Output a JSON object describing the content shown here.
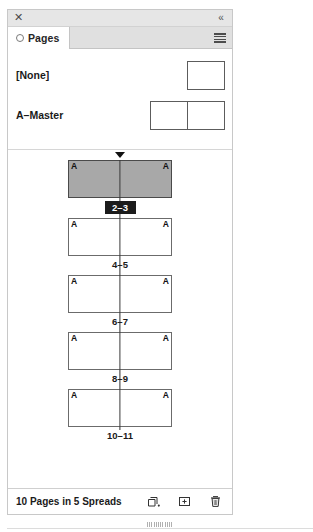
{
  "panel": {
    "titlebar": {
      "close_icon": "close-icon",
      "close_glyph": "✕",
      "collapse_icon": "collapse-double-chevron-icon",
      "collapse_glyph": "«"
    },
    "tab": {
      "label": "Pages",
      "status_icon": "ring-icon"
    },
    "menu_icon": "panel-menu-icon"
  },
  "masters": {
    "items": [
      {
        "name": "[None]",
        "pages": 1
      },
      {
        "name": "A–Master",
        "pages": 2
      }
    ]
  },
  "pages": {
    "spreads": [
      {
        "label": "2–3",
        "selected": true,
        "master_left": "A",
        "master_right": "A"
      },
      {
        "label": "4–5",
        "selected": false,
        "master_left": "A",
        "master_right": "A"
      },
      {
        "label": "6–7",
        "selected": false,
        "master_left": "A",
        "master_right": "A"
      },
      {
        "label": "8–9",
        "selected": false,
        "master_left": "A",
        "master_right": "A"
      },
      {
        "label": "10–11",
        "selected": false,
        "master_left": "A",
        "master_right": "A"
      }
    ]
  },
  "statusbar": {
    "summary": "10 Pages in 5 Spreads",
    "icons": [
      {
        "name": "edit-page-size-icon"
      },
      {
        "name": "create-new-page-icon"
      },
      {
        "name": "delete-selected-pages-icon"
      }
    ]
  }
}
